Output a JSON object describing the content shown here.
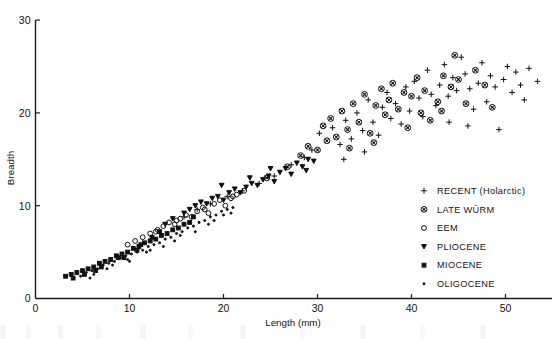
{
  "chart_data": {
    "type": "scatter",
    "title": "",
    "xlabel": "Length (mm)",
    "ylabel": "Breadth",
    "xlim": [
      0,
      55
    ],
    "ylim": [
      0,
      31
    ],
    "xticks": [
      0,
      10,
      20,
      30,
      40,
      50
    ],
    "yticks": [
      0,
      10,
      20,
      30
    ],
    "xtick_labels": [
      "0",
      "10",
      "20",
      "30",
      "40",
      "50"
    ],
    "ytick_labels": [
      "0",
      "10",
      "20",
      "30"
    ],
    "grid": false,
    "legend_position": "lower-right",
    "series": [
      {
        "name": "RECENT (Holarctic)",
        "marker": "plus",
        "points": [
          [
            30.2,
            17.8
          ],
          [
            31.6,
            18.4
          ],
          [
            32.4,
            16.6
          ],
          [
            33.0,
            19.2
          ],
          [
            33.6,
            17.2
          ],
          [
            34.2,
            20.0
          ],
          [
            34.8,
            18.1
          ],
          [
            35.4,
            21.4
          ],
          [
            35.9,
            19.0
          ],
          [
            36.5,
            17.6
          ],
          [
            36.9,
            20.6
          ],
          [
            37.4,
            22.2
          ],
          [
            37.8,
            19.4
          ],
          [
            38.3,
            21.0
          ],
          [
            38.9,
            18.8
          ],
          [
            39.4,
            22.8
          ],
          [
            39.8,
            20.2
          ],
          [
            40.3,
            23.4
          ],
          [
            40.8,
            21.6
          ],
          [
            41.2,
            19.6
          ],
          [
            41.7,
            24.6
          ],
          [
            42.1,
            22.0
          ],
          [
            42.6,
            20.8
          ],
          [
            43.0,
            23.0
          ],
          [
            43.5,
            25.2
          ],
          [
            43.9,
            21.8
          ],
          [
            44.4,
            23.8
          ],
          [
            44.8,
            22.4
          ],
          [
            45.3,
            26.0
          ],
          [
            45.7,
            24.2
          ],
          [
            46.2,
            22.6
          ],
          [
            46.6,
            20.4
          ],
          [
            47.1,
            23.2
          ],
          [
            47.5,
            25.4
          ],
          [
            48.0,
            21.2
          ],
          [
            48.4,
            24.0
          ],
          [
            48.9,
            22.8
          ],
          [
            49.3,
            18.2
          ],
          [
            49.8,
            23.6
          ],
          [
            50.2,
            25.0
          ],
          [
            50.7,
            22.2
          ],
          [
            51.1,
            24.4
          ],
          [
            51.6,
            23.0
          ],
          [
            52.0,
            21.4
          ],
          [
            52.5,
            24.8
          ],
          [
            53.4,
            23.4
          ],
          [
            29.4,
            16.0
          ],
          [
            28.6,
            15.2
          ],
          [
            27.2,
            14.4
          ],
          [
            25.4,
            13.2
          ],
          [
            23.8,
            12.4
          ],
          [
            22.0,
            11.6
          ],
          [
            20.4,
            11.0
          ],
          [
            18.6,
            10.2
          ],
          [
            17.2,
            9.6
          ],
          [
            15.8,
            8.8
          ],
          [
            44.0,
            19.0
          ],
          [
            46.0,
            18.6
          ],
          [
            35.0,
            15.8
          ],
          [
            32.8,
            15.0
          ]
        ]
      },
      {
        "name": "LATE WÜRM",
        "marker": "circled-cross",
        "points": [
          [
            24.6,
            13.0
          ],
          [
            26.8,
            14.2
          ],
          [
            29.0,
            16.4
          ],
          [
            30.0,
            16.0
          ],
          [
            30.6,
            18.6
          ],
          [
            31.0,
            17.0
          ],
          [
            31.4,
            19.4
          ],
          [
            32.0,
            17.4
          ],
          [
            32.6,
            20.2
          ],
          [
            33.2,
            18.2
          ],
          [
            33.8,
            21.0
          ],
          [
            34.4,
            19.0
          ],
          [
            35.0,
            22.0
          ],
          [
            35.6,
            17.8
          ],
          [
            36.2,
            20.8
          ],
          [
            36.8,
            22.6
          ],
          [
            37.2,
            19.8
          ],
          [
            37.6,
            21.4
          ],
          [
            38.0,
            23.2
          ],
          [
            38.6,
            20.4
          ],
          [
            39.2,
            22.2
          ],
          [
            39.6,
            18.4
          ],
          [
            40.0,
            21.8
          ],
          [
            40.6,
            23.8
          ],
          [
            41.0,
            20.0
          ],
          [
            41.4,
            22.4
          ],
          [
            42.0,
            19.2
          ],
          [
            42.8,
            21.2
          ],
          [
            43.4,
            24.0
          ],
          [
            44.2,
            22.8
          ],
          [
            45.0,
            23.6
          ],
          [
            45.8,
            21.0
          ],
          [
            46.8,
            24.6
          ],
          [
            47.8,
            23.0
          ],
          [
            48.6,
            20.6
          ],
          [
            28.2,
            15.4
          ],
          [
            33.4,
            16.2
          ],
          [
            36.0,
            16.8
          ],
          [
            43.2,
            20.2
          ],
          [
            44.6,
            26.2
          ]
        ]
      },
      {
        "name": "EEM",
        "marker": "open-circle",
        "points": [
          [
            11.4,
            6.6
          ],
          [
            12.2,
            7.0
          ],
          [
            13.0,
            7.4
          ],
          [
            13.6,
            7.8
          ],
          [
            14.2,
            8.2
          ],
          [
            14.8,
            8.0
          ],
          [
            15.4,
            8.6
          ],
          [
            16.0,
            9.0
          ],
          [
            16.6,
            8.8
          ],
          [
            17.2,
            9.4
          ],
          [
            17.8,
            9.8
          ],
          [
            18.4,
            9.2
          ],
          [
            19.0,
            10.2
          ],
          [
            19.6,
            10.6
          ],
          [
            20.2,
            10.0
          ],
          [
            20.8,
            10.8
          ],
          [
            21.4,
            11.2
          ],
          [
            22.2,
            11.6
          ],
          [
            10.6,
            6.2
          ],
          [
            9.8,
            5.8
          ],
          [
            12.8,
            7.2
          ],
          [
            15.0,
            8.4
          ],
          [
            18.0,
            9.6
          ],
          [
            21.0,
            11.0
          ]
        ]
      },
      {
        "name": "PLIOCENE",
        "marker": "small-triangle",
        "points": [
          [
            16.4,
            9.6
          ],
          [
            17.0,
            10.0
          ],
          [
            17.6,
            10.4
          ],
          [
            18.2,
            10.2
          ],
          [
            18.8,
            10.8
          ],
          [
            19.4,
            11.0
          ],
          [
            20.0,
            10.6
          ],
          [
            20.6,
            11.4
          ],
          [
            21.2,
            11.8
          ],
          [
            21.8,
            11.4
          ],
          [
            22.4,
            12.0
          ],
          [
            23.0,
            12.4
          ],
          [
            23.6,
            12.2
          ],
          [
            24.2,
            12.8
          ],
          [
            24.8,
            13.2
          ],
          [
            25.4,
            12.6
          ],
          [
            26.0,
            13.6
          ],
          [
            26.6,
            14.0
          ],
          [
            27.2,
            13.4
          ],
          [
            27.8,
            14.6
          ],
          [
            28.4,
            14.2
          ],
          [
            29.0,
            15.0
          ],
          [
            29.6,
            14.8
          ],
          [
            19.8,
            12.2
          ],
          [
            22.8,
            13.0
          ],
          [
            25.0,
            14.0
          ],
          [
            15.8,
            9.2
          ],
          [
            14.6,
            8.6
          ],
          [
            13.8,
            8.0
          ],
          [
            28.8,
            13.8
          ]
        ]
      },
      {
        "name": "MIOCENE",
        "marker": "filled-square",
        "points": [
          [
            3.2,
            2.4
          ],
          [
            3.8,
            2.6
          ],
          [
            4.4,
            2.8
          ],
          [
            5.0,
            3.0
          ],
          [
            5.6,
            3.2
          ],
          [
            6.2,
            3.4
          ],
          [
            6.8,
            3.8
          ],
          [
            7.4,
            4.0
          ],
          [
            8.0,
            4.2
          ],
          [
            8.6,
            4.6
          ],
          [
            9.2,
            4.8
          ],
          [
            9.8,
            5.0
          ],
          [
            10.4,
            5.4
          ],
          [
            11.0,
            5.6
          ],
          [
            11.6,
            6.0
          ],
          [
            12.2,
            6.2
          ],
          [
            12.8,
            6.4
          ],
          [
            13.4,
            6.8
          ],
          [
            14.0,
            7.0
          ],
          [
            14.6,
            7.4
          ],
          [
            15.2,
            7.6
          ],
          [
            15.8,
            8.0
          ],
          [
            16.4,
            8.2
          ],
          [
            4.0,
            2.2
          ],
          [
            5.2,
            2.6
          ],
          [
            7.0,
            3.4
          ],
          [
            8.8,
            4.4
          ],
          [
            10.8,
            5.2
          ],
          [
            12.4,
            6.6
          ],
          [
            13.2,
            7.2
          ],
          [
            6.4,
            3.0
          ],
          [
            9.4,
            4.4
          ],
          [
            11.2,
            5.8
          ],
          [
            16.8,
            8.8
          ]
        ]
      },
      {
        "name": "OLIGOCENE",
        "marker": "tiny-dot",
        "points": [
          [
            4.8,
            2.4
          ],
          [
            5.4,
            2.8
          ],
          [
            6.0,
            3.0
          ],
          [
            6.6,
            3.2
          ],
          [
            7.2,
            3.6
          ],
          [
            7.8,
            3.8
          ],
          [
            8.4,
            4.0
          ],
          [
            9.0,
            4.4
          ],
          [
            9.6,
            4.6
          ],
          [
            10.2,
            4.8
          ],
          [
            10.8,
            5.0
          ],
          [
            11.4,
            5.2
          ],
          [
            12.0,
            5.6
          ],
          [
            12.6,
            5.8
          ],
          [
            13.2,
            6.0
          ],
          [
            13.8,
            6.4
          ],
          [
            14.4,
            6.6
          ],
          [
            15.0,
            7.0
          ],
          [
            15.6,
            7.2
          ],
          [
            16.2,
            7.6
          ],
          [
            16.8,
            7.8
          ],
          [
            17.4,
            8.2
          ],
          [
            18.0,
            8.4
          ],
          [
            18.6,
            8.8
          ],
          [
            19.2,
            9.0
          ],
          [
            19.8,
            9.4
          ],
          [
            20.4,
            9.6
          ],
          [
            6.2,
            2.6
          ],
          [
            7.6,
            3.2
          ],
          [
            8.2,
            3.6
          ],
          [
            9.8,
            4.2
          ],
          [
            11.8,
            5.0
          ],
          [
            13.6,
            5.6
          ],
          [
            14.8,
            6.2
          ],
          [
            17.0,
            7.2
          ],
          [
            19.0,
            8.4
          ],
          [
            20.0,
            9.0
          ],
          [
            21.0,
            9.8
          ],
          [
            5.8,
            2.2
          ],
          [
            10.0,
            4.0
          ],
          [
            12.2,
            5.2
          ],
          [
            15.4,
            6.8
          ],
          [
            18.4,
            8.0
          ],
          [
            20.8,
            9.2
          ]
        ]
      }
    ]
  },
  "axes": {
    "x_title": "Length (mm)",
    "y_title": "Breadth",
    "x_tick_labels": [
      "0",
      "10",
      "20",
      "30",
      "40",
      "50"
    ],
    "y_tick_labels": [
      "0",
      "10",
      "20",
      "30"
    ]
  },
  "legend": {
    "items": [
      {
        "marker": "plus-marker",
        "label": "RECENT (Holarctic)"
      },
      {
        "marker": "circled-cross-marker",
        "label": "LATE WÜRM"
      },
      {
        "marker": "open-circle-marker",
        "label": "EEM"
      },
      {
        "marker": "small-triangle-marker",
        "label": "PLIOCENE"
      },
      {
        "marker": "filled-square-marker",
        "label": "MIOCENE"
      },
      {
        "marker": "tiny-dot-marker",
        "label": "OLIGOCENE"
      }
    ]
  },
  "colors": {
    "ink": "#141414",
    "background": "#ffffff"
  }
}
